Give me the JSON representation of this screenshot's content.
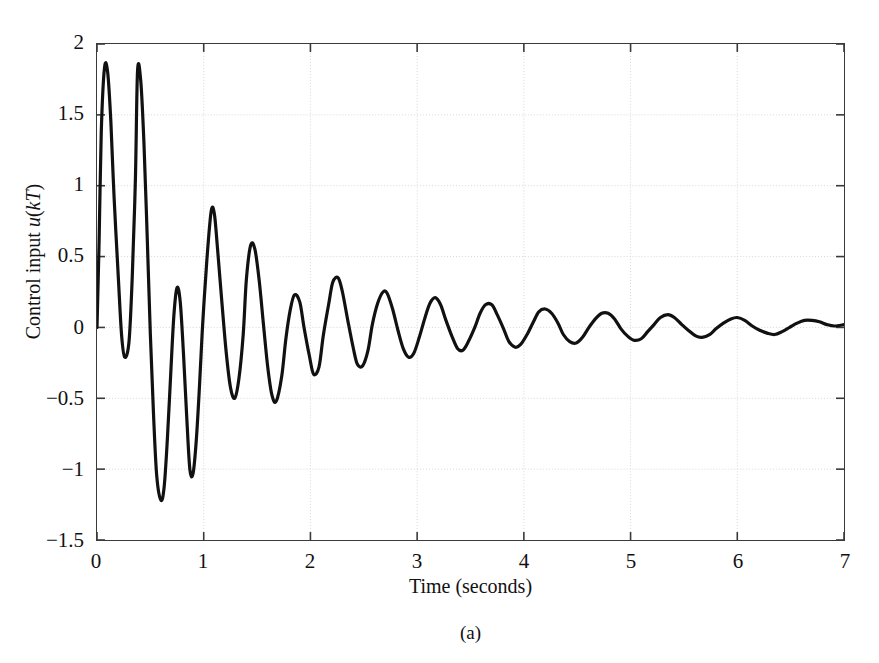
{
  "figure": {
    "caption": "(a)",
    "background_color": "#ffffff",
    "frame_color": "#3a3a3a",
    "grid_color": "#d8d8d8",
    "line_color": "#111111"
  },
  "chart_data": {
    "type": "line",
    "title": "",
    "xlabel": "Time (seconds)",
    "ylabel": "Control input u(kT)",
    "ylabel_parts": {
      "prefix": "Control input ",
      "symbol_u": "u",
      "paren_open": "(",
      "symbol_kT": "kT",
      "paren_close": ")"
    },
    "xlim": [
      0,
      7
    ],
    "ylim": [
      -1.5,
      2
    ],
    "xticks": [
      0,
      1,
      2,
      3,
      4,
      5,
      6,
      7
    ],
    "xtick_labels": [
      "0",
      "1",
      "2",
      "3",
      "4",
      "5",
      "6",
      "7"
    ],
    "yticks": [
      2,
      1.5,
      1,
      0.5,
      0,
      -0.5,
      -1,
      -1.5
    ],
    "ytick_labels": [
      "2",
      "1.5",
      "1",
      "0.5",
      "0",
      "−0.5",
      "−1",
      "−1.5"
    ],
    "grid": true,
    "grid_style": "dotted",
    "legend": null,
    "series": [
      {
        "name": "u(kT)",
        "color": "#111111",
        "linewidth": 3.2,
        "comment": "damped oscillatory control input; settles near 0.02",
        "x": [
          0.0,
          0.02,
          0.04,
          0.07,
          0.1,
          0.13,
          0.16,
          0.2,
          0.23,
          0.26,
          0.3,
          0.33,
          0.36,
          0.38,
          0.41,
          0.44,
          0.47,
          0.5,
          0.53,
          0.56,
          0.6,
          0.63,
          0.66,
          0.69,
          0.72,
          0.75,
          0.78,
          0.81,
          0.84,
          0.87,
          0.9,
          0.93,
          0.96,
          0.99,
          1.03,
          1.07,
          1.1,
          1.13,
          1.17,
          1.21,
          1.25,
          1.29,
          1.33,
          1.37,
          1.4,
          1.44,
          1.48,
          1.52,
          1.56,
          1.6,
          1.64,
          1.68,
          1.73,
          1.77,
          1.81,
          1.85,
          1.9,
          1.94,
          1.99,
          2.03,
          2.08,
          2.12,
          2.17,
          2.21,
          2.26,
          2.3,
          2.35,
          2.4,
          2.44,
          2.49,
          2.54,
          2.58,
          2.63,
          2.68,
          2.72,
          2.77,
          2.82,
          2.87,
          2.92,
          2.97,
          3.02,
          3.07,
          3.12,
          3.17,
          3.22,
          3.27,
          3.33,
          3.38,
          3.43,
          3.48,
          3.54,
          3.59,
          3.64,
          3.7,
          3.75,
          3.81,
          3.86,
          3.92,
          3.97,
          4.03,
          4.09,
          4.14,
          4.2,
          4.26,
          4.32,
          4.37,
          4.43,
          4.49,
          4.55,
          4.61,
          4.67,
          4.73,
          4.79,
          4.85,
          4.91,
          4.97,
          5.03,
          5.1,
          5.16,
          5.22,
          5.28,
          5.35,
          5.41,
          5.48,
          5.54,
          5.61,
          5.67,
          5.74,
          5.8,
          5.87,
          5.94,
          6.0,
          6.07,
          6.14,
          6.21,
          6.28,
          6.35,
          6.42,
          6.49,
          6.56,
          6.63,
          6.7,
          6.77,
          6.84,
          6.91,
          7.0
        ],
        "y": [
          0.0,
          0.62,
          1.38,
          1.83,
          1.8,
          1.45,
          0.92,
          0.35,
          -0.05,
          -0.21,
          -0.1,
          0.35,
          1.05,
          1.81,
          1.74,
          1.3,
          0.65,
          -0.05,
          -0.62,
          -1.05,
          -1.22,
          -1.12,
          -0.78,
          -0.34,
          0.08,
          0.28,
          0.18,
          -0.18,
          -0.62,
          -1.0,
          -1.03,
          -0.8,
          -0.42,
          0.02,
          0.48,
          0.82,
          0.8,
          0.55,
          0.18,
          -0.17,
          -0.42,
          -0.5,
          -0.36,
          -0.05,
          0.34,
          0.58,
          0.55,
          0.33,
          0.02,
          -0.28,
          -0.48,
          -0.52,
          -0.35,
          -0.08,
          0.12,
          0.23,
          0.18,
          0.0,
          -0.2,
          -0.33,
          -0.28,
          -0.06,
          0.16,
          0.32,
          0.35,
          0.25,
          0.05,
          -0.14,
          -0.26,
          -0.27,
          -0.16,
          0.02,
          0.17,
          0.25,
          0.24,
          0.13,
          -0.02,
          -0.15,
          -0.21,
          -0.18,
          -0.07,
          0.06,
          0.17,
          0.21,
          0.16,
          0.05,
          -0.07,
          -0.15,
          -0.16,
          -0.1,
          0.0,
          0.1,
          0.16,
          0.16,
          0.09,
          -0.01,
          -0.1,
          -0.14,
          -0.12,
          -0.05,
          0.04,
          0.11,
          0.13,
          0.1,
          0.03,
          -0.05,
          -0.1,
          -0.11,
          -0.07,
          0.0,
          0.06,
          0.1,
          0.1,
          0.06,
          -0.01,
          -0.06,
          -0.09,
          -0.08,
          -0.03,
          0.02,
          0.07,
          0.09,
          0.07,
          0.02,
          -0.02,
          -0.06,
          -0.07,
          -0.05,
          -0.01,
          0.03,
          0.06,
          0.07,
          0.05,
          0.01,
          -0.02,
          -0.04,
          -0.05,
          -0.03,
          0.0,
          0.03,
          0.05,
          0.05,
          0.04,
          0.02,
          0.01,
          0.02
        ]
      }
    ],
    "annotations": [],
    "settling_value": 0.02
  }
}
